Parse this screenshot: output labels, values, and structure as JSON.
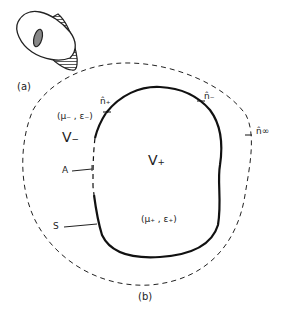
{
  "figure": {
    "part_a": {
      "caption": "(a)",
      "object": "hollow-cylinder-with-hatched-side"
    },
    "part_b": {
      "caption": "(b)",
      "regions": {
        "outer": "V₋",
        "inner": "V₊"
      },
      "materials": {
        "outer": "(μ₋ , ε₋)",
        "inner": "(μ₊ , ε₊)"
      },
      "normals": {
        "plus": "n̂₊",
        "minus": "n̂₋",
        "infinity": "n̂∞"
      },
      "boundary_labels": {
        "aperture": "A",
        "surface": "S"
      }
    }
  },
  "colors": {
    "ink": "#222222",
    "background": "#ffffff"
  }
}
